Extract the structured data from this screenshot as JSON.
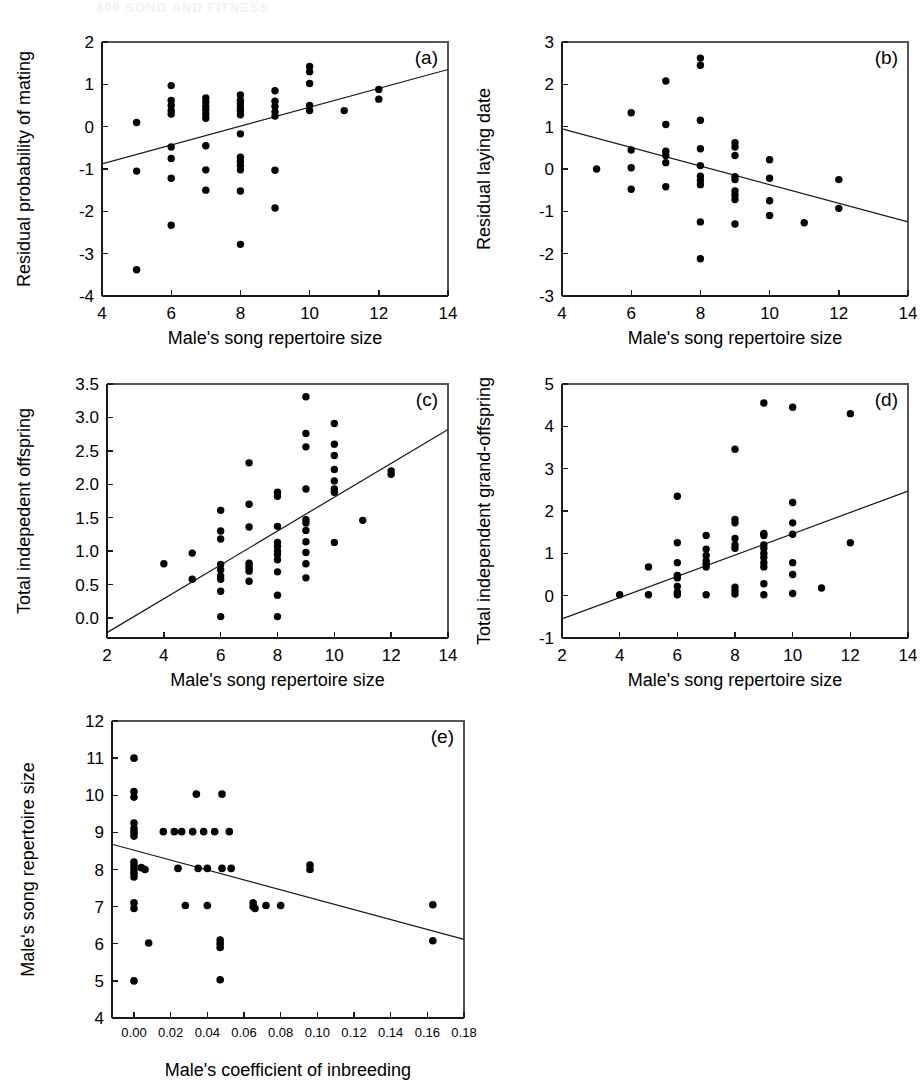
{
  "page": {
    "header_text": "400      SONG AND FITNESS"
  },
  "figure": {
    "panels": [
      "a",
      "b",
      "c",
      "d",
      "e"
    ],
    "point_color": "#000000",
    "line_color": "#1a1a1a",
    "axis_color": "#1a1a1a"
  },
  "chart_data": [
    {
      "type": "scatter",
      "panel_label": "(a)",
      "title": "",
      "xlabel": "Male's song repertoire size",
      "ylabel": "Residual probability of mating",
      "xlim": [
        4,
        14
      ],
      "ylim": [
        -4,
        2
      ],
      "xticks": [
        4,
        6,
        8,
        10,
        12,
        14
      ],
      "yticks": [
        -4,
        -3,
        -2,
        -1,
        0,
        1,
        2
      ],
      "xtick_labels": [
        "4",
        "6",
        "8",
        "10",
        "12",
        "14"
      ],
      "ytick_labels": [
        "-4",
        "-3",
        "-2",
        "-1",
        "0",
        "1",
        "2"
      ],
      "grid": false,
      "legend": "none",
      "trendline": {
        "x": [
          4,
          14
        ],
        "y": [
          -0.88,
          1.35
        ]
      },
      "points": [
        [
          5,
          0.1
        ],
        [
          5,
          -1.05
        ],
        [
          5,
          -3.38
        ],
        [
          6,
          0.97
        ],
        [
          6,
          0.62
        ],
        [
          6,
          0.5
        ],
        [
          6,
          0.38
        ],
        [
          6,
          0.3
        ],
        [
          6,
          -0.48
        ],
        [
          6,
          -0.75
        ],
        [
          6,
          -1.22
        ],
        [
          6,
          -2.33
        ],
        [
          7,
          0.68
        ],
        [
          7,
          0.58
        ],
        [
          7,
          0.48
        ],
        [
          7,
          0.4
        ],
        [
          7,
          0.3
        ],
        [
          7,
          0.2
        ],
        [
          7,
          -0.45
        ],
        [
          7,
          -1.02
        ],
        [
          7,
          -1.5
        ],
        [
          8,
          0.75
        ],
        [
          8,
          0.62
        ],
        [
          8,
          0.55
        ],
        [
          8,
          0.45
        ],
        [
          8,
          0.38
        ],
        [
          8,
          0.28
        ],
        [
          8,
          -0.17
        ],
        [
          8,
          -0.72
        ],
        [
          8,
          -0.82
        ],
        [
          8,
          -0.92
        ],
        [
          8,
          -1.02
        ],
        [
          8,
          -1.52
        ],
        [
          8,
          -2.78
        ],
        [
          9,
          0.85
        ],
        [
          9,
          0.6
        ],
        [
          9,
          0.48
        ],
        [
          9,
          0.35
        ],
        [
          9,
          0.25
        ],
        [
          9,
          -1.03
        ],
        [
          9,
          -1.92
        ],
        [
          10,
          1.42
        ],
        [
          10,
          1.3
        ],
        [
          10,
          1.02
        ],
        [
          10,
          0.5
        ],
        [
          10,
          0.38
        ],
        [
          11,
          0.38
        ],
        [
          12,
          0.88
        ],
        [
          12,
          0.65
        ]
      ]
    },
    {
      "type": "scatter",
      "panel_label": "(b)",
      "title": "",
      "xlabel": "Male's song repertoire size",
      "ylabel": "Residual laying date",
      "xlim": [
        4,
        14
      ],
      "ylim": [
        -3,
        3
      ],
      "xticks": [
        4,
        6,
        8,
        10,
        12,
        14
      ],
      "yticks": [
        -3,
        -2,
        -1,
        0,
        1,
        2,
        3
      ],
      "xtick_labels": [
        "4",
        "6",
        "8",
        "10",
        "12",
        "14"
      ],
      "ytick_labels": [
        "-3",
        "-2",
        "-1",
        "0",
        "1",
        "2",
        "3"
      ],
      "grid": false,
      "legend": "none",
      "trendline": {
        "x": [
          4,
          14
        ],
        "y": [
          0.95,
          -1.25
        ]
      },
      "points": [
        [
          5,
          0.0
        ],
        [
          6,
          1.33
        ],
        [
          6,
          0.45
        ],
        [
          6,
          0.03
        ],
        [
          6,
          -0.48
        ],
        [
          7,
          2.08
        ],
        [
          7,
          1.05
        ],
        [
          7,
          0.42
        ],
        [
          7,
          0.32
        ],
        [
          7,
          0.15
        ],
        [
          7,
          -0.42
        ],
        [
          8,
          2.62
        ],
        [
          8,
          2.45
        ],
        [
          8,
          1.15
        ],
        [
          8,
          0.48
        ],
        [
          8,
          0.08
        ],
        [
          8,
          -0.17
        ],
        [
          8,
          -0.27
        ],
        [
          8,
          -0.37
        ],
        [
          8,
          -1.25
        ],
        [
          8,
          -2.12
        ],
        [
          9,
          0.62
        ],
        [
          9,
          0.52
        ],
        [
          9,
          0.32
        ],
        [
          9,
          -0.18
        ],
        [
          9,
          -0.25
        ],
        [
          9,
          -0.52
        ],
        [
          9,
          -0.62
        ],
        [
          9,
          -0.72
        ],
        [
          9,
          -1.3
        ],
        [
          10,
          0.22
        ],
        [
          10,
          -0.22
        ],
        [
          10,
          -0.75
        ],
        [
          10,
          -1.1
        ],
        [
          11,
          -1.27
        ],
        [
          12,
          -0.25
        ],
        [
          12,
          -0.93
        ]
      ]
    },
    {
      "type": "scatter",
      "panel_label": "(c)",
      "title": "",
      "xlabel": "Male's song repertoire size",
      "ylabel": "Total indepedent offspring",
      "xlim": [
        2,
        14
      ],
      "ylim": [
        -0.3,
        3.5
      ],
      "xticks": [
        2,
        4,
        6,
        8,
        10,
        12,
        14
      ],
      "yticks": [
        0.0,
        0.5,
        1.0,
        1.5,
        2.0,
        2.5,
        3.0,
        3.5
      ],
      "xtick_labels": [
        "2",
        "4",
        "6",
        "8",
        "10",
        "12",
        "14"
      ],
      "ytick_labels": [
        "0.0",
        "0.5",
        "1.0",
        "1.5",
        "2.0",
        "2.5",
        "3.0",
        "3.5"
      ],
      "grid": false,
      "legend": "none",
      "trendline": {
        "x": [
          2,
          14
        ],
        "y": [
          -0.22,
          2.82
        ]
      },
      "points": [
        [
          4,
          0.81
        ],
        [
          5,
          0.97
        ],
        [
          5,
          0.58
        ],
        [
          6,
          1.61
        ],
        [
          6,
          1.3
        ],
        [
          6,
          1.18
        ],
        [
          6,
          0.8
        ],
        [
          6,
          0.72
        ],
        [
          6,
          0.63
        ],
        [
          6,
          0.58
        ],
        [
          6,
          0.4
        ],
        [
          6,
          0.02
        ],
        [
          7,
          2.32
        ],
        [
          7,
          1.7
        ],
        [
          7,
          1.36
        ],
        [
          7,
          0.82
        ],
        [
          7,
          0.78
        ],
        [
          7,
          0.74
        ],
        [
          7,
          0.7
        ],
        [
          7,
          0.55
        ],
        [
          8,
          1.88
        ],
        [
          8,
          1.82
        ],
        [
          8,
          1.37
        ],
        [
          8,
          1.13
        ],
        [
          8,
          1.07
        ],
        [
          8,
          1.0
        ],
        [
          8,
          0.95
        ],
        [
          8,
          0.87
        ],
        [
          8,
          0.69
        ],
        [
          8,
          0.34
        ],
        [
          8,
          0.02
        ],
        [
          9,
          3.31
        ],
        [
          9,
          2.76
        ],
        [
          9,
          2.56
        ],
        [
          9,
          1.93
        ],
        [
          9,
          1.47
        ],
        [
          9,
          1.42
        ],
        [
          9,
          1.31
        ],
        [
          9,
          1.14
        ],
        [
          9,
          0.98
        ],
        [
          9,
          0.81
        ],
        [
          9,
          0.6
        ],
        [
          10,
          2.91
        ],
        [
          10,
          2.6
        ],
        [
          10,
          2.43
        ],
        [
          10,
          2.22
        ],
        [
          10,
          2.05
        ],
        [
          10,
          1.93
        ],
        [
          10,
          1.88
        ],
        [
          10,
          1.13
        ],
        [
          11,
          1.46
        ],
        [
          12,
          2.2
        ],
        [
          12,
          2.15
        ]
      ]
    },
    {
      "type": "scatter",
      "panel_label": "(d)",
      "title": "",
      "xlabel": "Male's song repertoire size",
      "ylabel": "Total independent grand-offspring",
      "xlim": [
        2,
        14
      ],
      "ylim": [
        -1,
        5
      ],
      "xticks": [
        2,
        4,
        6,
        8,
        10,
        12,
        14
      ],
      "yticks": [
        -1,
        0,
        1,
        2,
        3,
        4,
        5
      ],
      "xtick_labels": [
        "2",
        "4",
        "6",
        "8",
        "10",
        "12",
        "14"
      ],
      "ytick_labels": [
        "-1",
        "0",
        "1",
        "2",
        "3",
        "4",
        "5"
      ],
      "grid": false,
      "legend": "none",
      "trendline": {
        "x": [
          2,
          14
        ],
        "y": [
          -0.55,
          2.47
        ]
      },
      "points": [
        [
          4,
          0.02
        ],
        [
          5,
          0.68
        ],
        [
          5,
          0.02
        ],
        [
          6,
          2.35
        ],
        [
          6,
          1.25
        ],
        [
          6,
          0.78
        ],
        [
          6,
          0.48
        ],
        [
          6,
          0.42
        ],
        [
          6,
          0.22
        ],
        [
          6,
          0.08
        ],
        [
          6,
          0.02
        ],
        [
          7,
          1.42
        ],
        [
          7,
          1.1
        ],
        [
          7,
          0.95
        ],
        [
          7,
          0.82
        ],
        [
          7,
          0.75
        ],
        [
          7,
          0.68
        ],
        [
          7,
          0.02
        ],
        [
          8,
          3.46
        ],
        [
          8,
          1.8
        ],
        [
          8,
          1.72
        ],
        [
          8,
          1.35
        ],
        [
          8,
          1.2
        ],
        [
          8,
          1.12
        ],
        [
          8,
          0.2
        ],
        [
          8,
          0.12
        ],
        [
          8,
          0.04
        ],
        [
          9,
          4.55
        ],
        [
          9,
          1.47
        ],
        [
          9,
          1.42
        ],
        [
          9,
          1.2
        ],
        [
          9,
          1.12
        ],
        [
          9,
          1.0
        ],
        [
          9,
          0.9
        ],
        [
          9,
          0.78
        ],
        [
          9,
          0.68
        ],
        [
          9,
          0.28
        ],
        [
          9,
          0.02
        ],
        [
          10,
          4.45
        ],
        [
          10,
          2.2
        ],
        [
          10,
          1.72
        ],
        [
          10,
          1.45
        ],
        [
          10,
          0.78
        ],
        [
          10,
          0.5
        ],
        [
          10,
          0.05
        ],
        [
          11,
          0.18
        ],
        [
          12,
          4.3
        ],
        [
          12,
          1.25
        ]
      ]
    },
    {
      "type": "scatter",
      "panel_label": "(e)",
      "title": "",
      "xlabel": "Male's coefficient of inbreeding",
      "ylabel": "Male's song repertoire size",
      "xlim": [
        -0.012,
        0.18
      ],
      "ylim": [
        4,
        12
      ],
      "xticks": [
        0.0,
        0.02,
        0.04,
        0.06,
        0.08,
        0.1,
        0.12,
        0.14,
        0.16,
        0.18
      ],
      "yticks": [
        4,
        5,
        6,
        7,
        8,
        9,
        10,
        11,
        12
      ],
      "xtick_labels": [
        "0.00",
        "0.02",
        "0.04",
        "0.06",
        "0.08",
        "0.10",
        "0.12",
        "0.14",
        "0.16",
        "0.18"
      ],
      "ytick_labels": [
        "4",
        "5",
        "6",
        "7",
        "8",
        "9",
        "10",
        "11",
        "12"
      ],
      "grid": false,
      "legend": "none",
      "trendline": {
        "x": [
          -0.012,
          0.18
        ],
        "y": [
          8.68,
          6.12
        ]
      },
      "points": [
        [
          0.0,
          11.0
        ],
        [
          0.0,
          10.1
        ],
        [
          0.0,
          9.95
        ],
        [
          0.0,
          9.25
        ],
        [
          0.0,
          9.1
        ],
        [
          0.0,
          9.0
        ],
        [
          0.0,
          8.9
        ],
        [
          0.0,
          8.2
        ],
        [
          0.0,
          8.1
        ],
        [
          0.0,
          8.0
        ],
        [
          0.0,
          7.9
        ],
        [
          0.0,
          7.8
        ],
        [
          0.0,
          7.1
        ],
        [
          0.0,
          6.95
        ],
        [
          0.0,
          5.0
        ],
        [
          0.004,
          8.05
        ],
        [
          0.006,
          8.0
        ],
        [
          0.008,
          6.02
        ],
        [
          0.016,
          9.02
        ],
        [
          0.022,
          9.02
        ],
        [
          0.024,
          8.03
        ],
        [
          0.026,
          9.02
        ],
        [
          0.028,
          7.03
        ],
        [
          0.032,
          9.02
        ],
        [
          0.034,
          10.03
        ],
        [
          0.035,
          8.03
        ],
        [
          0.038,
          9.02
        ],
        [
          0.04,
          8.03
        ],
        [
          0.04,
          7.03
        ],
        [
          0.044,
          9.02
        ],
        [
          0.047,
          6.1
        ],
        [
          0.047,
          6.0
        ],
        [
          0.047,
          5.9
        ],
        [
          0.047,
          5.03
        ],
        [
          0.048,
          10.03
        ],
        [
          0.048,
          8.03
        ],
        [
          0.052,
          9.02
        ],
        [
          0.053,
          8.03
        ],
        [
          0.065,
          7.1
        ],
        [
          0.065,
          7.0
        ],
        [
          0.066,
          6.95
        ],
        [
          0.072,
          7.03
        ],
        [
          0.08,
          7.03
        ],
        [
          0.096,
          8.12
        ],
        [
          0.096,
          8.0
        ],
        [
          0.163,
          7.05
        ],
        [
          0.163,
          6.08
        ]
      ]
    }
  ]
}
